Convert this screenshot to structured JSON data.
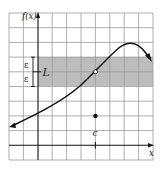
{
  "figure": {
    "y_axis_label": "f(x)",
    "x_axis_label": "x",
    "limit_label": "L",
    "point_label": "c",
    "epsilon_upper": "ε",
    "epsilon_lower": "ε"
  },
  "colors": {
    "grid": "#9a9a9a",
    "band": "#bdbdbd",
    "curve": "#111111",
    "axis": "#111111"
  }
}
